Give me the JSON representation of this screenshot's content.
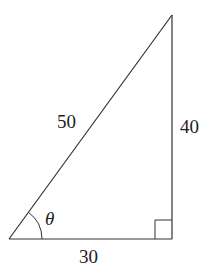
{
  "diagram": {
    "type": "right-triangle",
    "colors": {
      "stroke": "#333333",
      "text": "#222222",
      "background": "#ffffff"
    },
    "vertices": {
      "bottom_left": {
        "x": 9,
        "y": 239
      },
      "bottom_right": {
        "x": 172,
        "y": 239
      },
      "top": {
        "x": 172,
        "y": 15
      }
    },
    "sides": {
      "hypotenuse": {
        "label": "50"
      },
      "vertical_leg": {
        "label": "40"
      },
      "horizontal_leg": {
        "label": "30"
      }
    },
    "angle": {
      "label": "θ",
      "vertex": "bottom_left"
    },
    "right_angle_marker": {
      "vertex": "bottom_right"
    }
  }
}
